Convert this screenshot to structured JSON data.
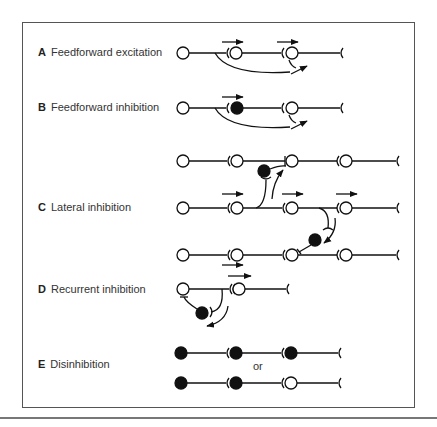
{
  "figure": {
    "panels": [
      {
        "letter": "A",
        "title": "Feedforward excitation"
      },
      {
        "letter": "B",
        "title": "Feedforward inhibition"
      },
      {
        "letter": "C",
        "title": "Lateral inhibition"
      },
      {
        "letter": "D",
        "title": "Recurrent inhibition"
      },
      {
        "letter": "E",
        "title": "Disinhibition"
      }
    ],
    "or_text": "or",
    "legend_semantics": {
      "open_circle": "excitatory neuron",
      "filled_circle": "inhibitory neuron",
      "arrow": "direction of signal propagation"
    }
  }
}
